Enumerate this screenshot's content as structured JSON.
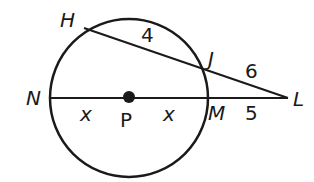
{
  "diagram": {
    "type": "circle-secant-diagram",
    "colors": {
      "stroke": "#1a1a1a",
      "background": "#ffffff"
    },
    "circle": {
      "center_label": "P"
    },
    "points": {
      "H": "H",
      "J": "J",
      "N": "N",
      "M": "M",
      "L": "L",
      "P": "P"
    },
    "segment_labels": {
      "HJ": "4",
      "JL": "6",
      "ML": "5",
      "NP": "x",
      "PM": "x"
    }
  }
}
